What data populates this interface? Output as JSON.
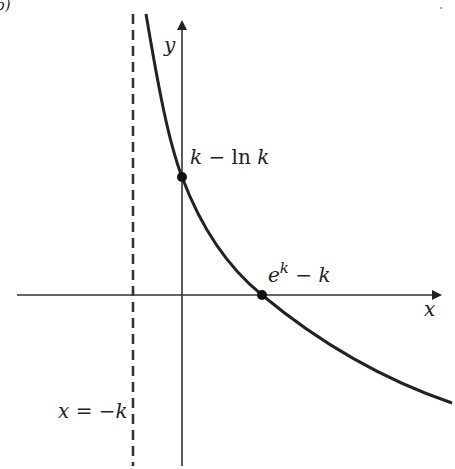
{
  "figure": {
    "panel_label": "b)",
    "axes": {
      "x_label": "x",
      "y_label": "y"
    },
    "asymptote": {
      "label": "x = −k",
      "label_parts": {
        "lhs": "x",
        "eq": " = −",
        "rhs": "k"
      }
    },
    "points": [
      {
        "name": "y-intercept",
        "label": "k − ln k",
        "parts": {
          "a": "k",
          "op": " − ",
          "fn": "ln ",
          "b": "k"
        }
      },
      {
        "name": "x-intercept",
        "label": "e^k − k",
        "parts": {
          "base": "e",
          "exp": "k",
          "op": " − ",
          "b": "k"
        }
      }
    ],
    "colors": {
      "curve": "#222222",
      "axes": "#333333",
      "asymptote": "#333333",
      "background": "#ffffff"
    }
  }
}
